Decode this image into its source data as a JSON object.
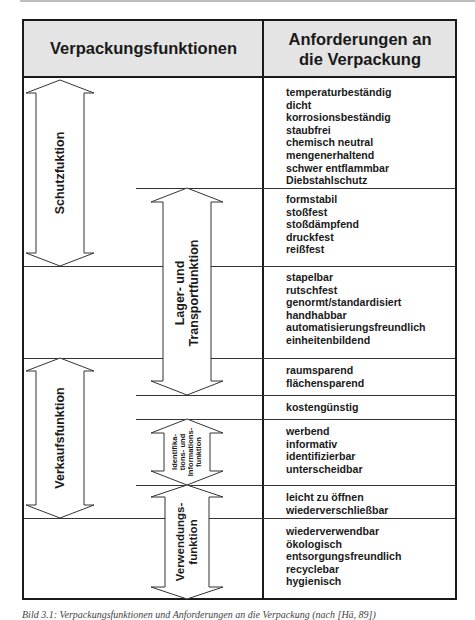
{
  "header": {
    "left": "Verpackungsfunktionen",
    "right_line1": "Anforderungen an",
    "right_line2": "die Verpackung"
  },
  "functions": [
    {
      "id": "schutz",
      "label": "Schutzfuktion"
    },
    {
      "id": "lager",
      "label_line1": "Lager- und",
      "label_line2": "Transportfunktion"
    },
    {
      "id": "verkauf",
      "label": "Verkaufsfunktion"
    },
    {
      "id": "ident",
      "label_line1": "Identifika-",
      "label_line2": "tions- und",
      "label_line3": "Informations-",
      "label_line4": "funktion"
    },
    {
      "id": "verwendung",
      "label_line1": "Verwendungs-",
      "label_line2": "funktion"
    }
  ],
  "requirements": [
    {
      "group": "schutz",
      "items": [
        "temperaturbeständig",
        "dicht",
        "korrosionsbeständig",
        "staubfrei",
        "chemisch neutral",
        "mengenerhaltend",
        "schwer entflammbar",
        "Diebstahlschutz"
      ]
    },
    {
      "group": "schutz+lager",
      "items": [
        "formstabil",
        "stoßfest",
        "stoßdämpfend",
        "druckfest",
        "reißfest"
      ]
    },
    {
      "group": "lager",
      "items": [
        "stapelbar",
        "rutschfest",
        "genormt/standardisiert",
        "handhabbar",
        "automatisierungsfreundlich",
        "einheitenbildend"
      ]
    },
    {
      "group": "lager+verkauf",
      "items": [
        "raumsparend",
        "flächensparend"
      ]
    },
    {
      "group": "verkauf",
      "items": [
        "kostengünstig"
      ]
    },
    {
      "group": "verkauf+ident",
      "items": [
        "werbend",
        "informativ",
        "identifizierbar",
        "unterscheidbar"
      ]
    },
    {
      "group": "verkauf+verwendung",
      "items": [
        "leicht zu öffnen",
        "wiederverschließbar"
      ]
    },
    {
      "group": "verwendung",
      "items": [
        "wiederverwendbar",
        "ökologisch",
        "entsorgungsfreundlich",
        "recyclebar",
        "hygienisch"
      ]
    }
  ],
  "caption": "Bild 3.1: Verpackungsfunktionen und Anforderungen an die Verpackung (nach [Hä, 89])"
}
